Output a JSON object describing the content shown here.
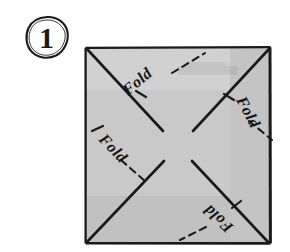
{
  "figure": {
    "kind": "folding-instruction-diagram",
    "step_number": "1",
    "background_color": "#ffffff",
    "ink_color": "#1a1a1a"
  },
  "step_badge": {
    "label": "1",
    "shape": "hand-drawn-circle"
  },
  "sheet": {
    "name": "square-sheet",
    "fill_color": "#c9c9c9",
    "edge_color": "#1a1a1a",
    "x": 85,
    "y": 47,
    "width": 186,
    "height": 197
  },
  "fold_lines": [
    {
      "name": "diagonal-tl-br",
      "from": "top-left-corner",
      "to": "bottom-right-corner"
    },
    {
      "name": "diagonal-bl-tr",
      "from": "bottom-left-corner",
      "to": "top-right-corner"
    }
  ],
  "labels": [
    {
      "id": "fold-top-left",
      "text": "Fold",
      "rotation_deg": -40,
      "x": 128,
      "y": 92
    },
    {
      "id": "fold-top-right",
      "text": "Fold",
      "rotation_deg": 62,
      "x": 238,
      "y": 96
    },
    {
      "id": "fold-left",
      "text": "Fold",
      "rotation_deg": 46,
      "x": 96,
      "y": 137
    },
    {
      "id": "fold-bottom-right",
      "text": "Fold",
      "rotation_deg": 222,
      "x": 232,
      "y": 225
    }
  ],
  "leader_lines": {
    "style": "dashed",
    "count": 4
  }
}
